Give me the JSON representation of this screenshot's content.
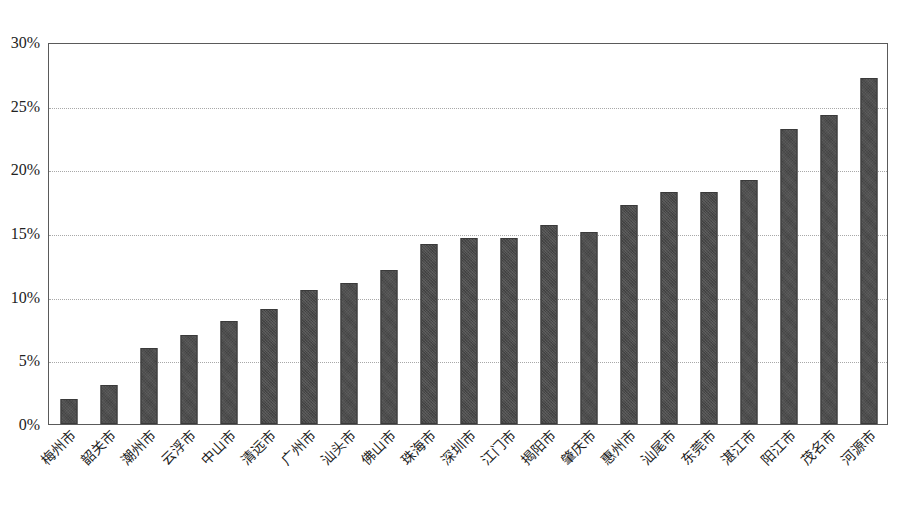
{
  "chart_data": {
    "type": "bar",
    "title": "",
    "subtitle": "",
    "xlabel": "",
    "ylabel": "",
    "ylim": [
      0,
      30
    ],
    "y_tick_labels": [
      "0%",
      "5%",
      "10%",
      "15%",
      "20%",
      "25%",
      "30%"
    ],
    "y_tick_values": [
      0,
      5,
      10,
      15,
      20,
      25,
      30
    ],
    "grid": true,
    "legend": null,
    "legend_position": "none",
    "value_suffix": "%",
    "categories": [
      "梅州市",
      "韶关市",
      "潮州市",
      "云浮市",
      "中山市",
      "清远市",
      "广州市",
      "汕头市",
      "佛山市",
      "珠海市",
      "深圳市",
      "江门市",
      "揭阳市",
      "肇庆市",
      "惠州市",
      "汕尾市",
      "东莞市",
      "湛江市",
      "阳江市",
      "茂名市",
      "河源市"
    ],
    "values": [
      2.0,
      3.1,
      6.0,
      7.0,
      8.1,
      9.0,
      10.5,
      11.1,
      12.1,
      14.1,
      14.6,
      14.6,
      15.6,
      15.1,
      17.2,
      18.2,
      18.2,
      19.2,
      23.2,
      24.3,
      27.2
    ],
    "series": [
      {
        "name": "",
        "values": [
          2.0,
          3.1,
          6.0,
          7.0,
          8.1,
          9.0,
          10.5,
          11.1,
          12.1,
          14.1,
          14.6,
          14.6,
          15.6,
          15.1,
          17.2,
          18.2,
          18.2,
          19.2,
          23.2,
          24.3,
          27.2
        ]
      }
    ],
    "bar_color": "#4b4b4b",
    "plot_border_color": "#5a5a5a",
    "gridline_color": "#a8a8a8",
    "background_color": "#ffffff"
  }
}
